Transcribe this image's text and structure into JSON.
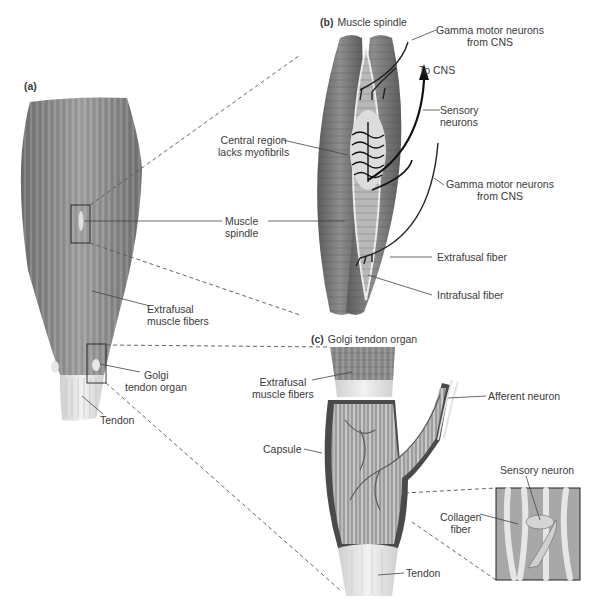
{
  "figure": {
    "panels": {
      "a": {
        "letter": "(a)"
      },
      "b": {
        "letter": "(b)",
        "title": "Muscle spindle"
      },
      "c": {
        "letter": "(c)",
        "title": "Golgi tendon organ"
      }
    },
    "labels_a": {
      "muscle_spindle_1": "Muscle",
      "muscle_spindle_2": "spindle",
      "extrafusal_1": "Extrafusal",
      "extrafusal_2": "muscle fibers",
      "golgi_1": "Golgi",
      "golgi_2": "tendon organ",
      "tendon": "Tendon"
    },
    "labels_b": {
      "gamma_top_1": "Gamma motor neurons",
      "gamma_top_2": "from CNS",
      "to_cns": "To CNS",
      "sensory_1": "Sensory",
      "sensory_2": "neurons",
      "central_1": "Central region",
      "central_2": "lacks myofibrils",
      "gamma_bottom_1": "Gamma motor neurons",
      "gamma_bottom_2": "from CNS",
      "extrafusal_fiber": "Extrafusal fiber",
      "intrafusal_fiber": "Intrafusal fiber"
    },
    "labels_c": {
      "extrafusal_1": "Extrafusal",
      "extrafusal_2": "muscle fibers",
      "afferent": "Afferent neuron",
      "capsule": "Capsule",
      "sensory_neuron": "Sensory neuron",
      "collagen_1": "Collagen",
      "collagen_2": "fiber",
      "tendon": "Tendon"
    },
    "colors": {
      "muscle": "#8a8a8a",
      "muscle_dark": "#5e5e5e",
      "tendon": "#e4e4e4",
      "line": "#444444"
    }
  }
}
